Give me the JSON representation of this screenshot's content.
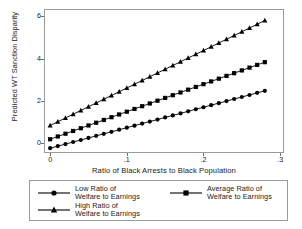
{
  "chart_data": {
    "type": "line",
    "title": "",
    "xlabel": "Ratio of Black Arrests to Black Population",
    "ylabel": "Predicted WT Sanction Disparity",
    "xlim": [
      -0.008,
      0.305
    ],
    "ylim": [
      -0.45,
      6.35
    ],
    "xticks": [
      0,
      0.1,
      0.2,
      0.3
    ],
    "xticklabels": [
      "0",
      ".1",
      ".2",
      ".3"
    ],
    "yticks": [
      0,
      2,
      4,
      6
    ],
    "yticklabels": [
      "0",
      "2",
      "4",
      "6"
    ],
    "grid": false,
    "legend_position": "below-axes",
    "x": [
      0,
      0.01,
      0.02,
      0.03,
      0.04,
      0.05,
      0.06,
      0.07,
      0.08,
      0.09,
      0.1,
      0.11,
      0.12,
      0.13,
      0.14,
      0.15,
      0.16,
      0.17,
      0.18,
      0.19,
      0.2,
      0.21,
      0.22,
      0.23,
      0.24,
      0.25,
      0.26,
      0.27,
      0.28
    ],
    "series": [
      {
        "name": "Low Ratio of Welfare to Earnings",
        "marker": "circle",
        "values": [
          -0.22,
          -0.125,
          -0.03,
          0.07,
          0.165,
          0.26,
          0.36,
          0.455,
          0.55,
          0.65,
          0.745,
          0.84,
          0.94,
          1.035,
          1.13,
          1.23,
          1.325,
          1.42,
          1.52,
          1.615,
          1.71,
          1.81,
          1.905,
          2.0,
          2.1,
          2.195,
          2.29,
          2.39,
          2.485
        ]
      },
      {
        "name": "Average Ratio of Welfare to Earnings",
        "marker": "square",
        "values": [
          0.2,
          0.33,
          0.46,
          0.59,
          0.72,
          0.85,
          0.98,
          1.11,
          1.24,
          1.37,
          1.5,
          1.63,
          1.76,
          1.89,
          2.02,
          2.15,
          2.28,
          2.41,
          2.54,
          2.67,
          2.8,
          2.93,
          3.06,
          3.19,
          3.32,
          3.45,
          3.58,
          3.71,
          3.84
        ]
      },
      {
        "name": "High Ratio of Welfare to Earnings",
        "marker": "triangle",
        "values": [
          0.85,
          1.027,
          1.204,
          1.381,
          1.558,
          1.735,
          1.912,
          2.089,
          2.266,
          2.443,
          2.62,
          2.797,
          2.974,
          3.151,
          3.328,
          3.505,
          3.682,
          3.859,
          4.036,
          4.213,
          4.39,
          4.567,
          4.744,
          4.921,
          5.098,
          5.275,
          5.452,
          5.629,
          5.806
        ]
      }
    ]
  },
  "legend": {
    "items": [
      {
        "label": "Low Ratio of\nWelfare to Earnings",
        "marker": "circle"
      },
      {
        "label": "Average Ratio of\nWelfare to Earnings",
        "marker": "square"
      },
      {
        "label": "High Ratio of\nWelfare to Earnings",
        "marker": "triangle"
      }
    ]
  },
  "colors": {
    "line": "#000000",
    "marker": "#000000",
    "frame": "#9a9a9a",
    "text": "#1a1a1a",
    "background": "#ffffff"
  }
}
